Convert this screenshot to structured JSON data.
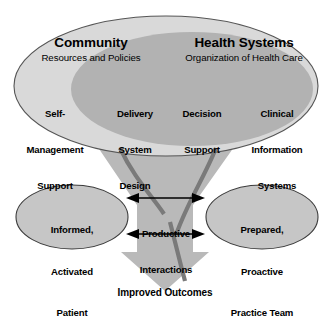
{
  "diagram": {
    "colors": {
      "background": "#ffffff",
      "outer_ellipse_fill": "#d9d9d9",
      "inner_ellipse_fill": "#b2b2b2",
      "small_oval_fill": "#c6c6c6",
      "funnel_fill": "#b9b9b9",
      "arrow_fill": "#b9b9b9",
      "curve_stroke": "#7a7a7a",
      "outline": "#3b3b3b",
      "text": "#000000"
    },
    "community": {
      "heading": "Community",
      "subheading": "Resources and Policies"
    },
    "health_systems": {
      "heading": "Health Systems",
      "subheading": "Organization of Health Care"
    },
    "pillars": [
      {
        "id": "self-management-support",
        "lines": [
          "Self-",
          "Management",
          "Support"
        ]
      },
      {
        "id": "delivery-system-design",
        "lines": [
          "Delivery",
          "System",
          "Design"
        ]
      },
      {
        "id": "decision-support",
        "lines": [
          "Decision",
          "Support"
        ]
      },
      {
        "id": "clinical-information-systems",
        "lines": [
          "Clinical",
          "Information",
          "Systems"
        ]
      }
    ],
    "patient_oval": {
      "lines": [
        "Informed,",
        "Activated",
        "Patient"
      ]
    },
    "team_oval": {
      "lines": [
        "Prepared,",
        "Proactive",
        "Practice Team"
      ]
    },
    "interactions": {
      "lines": [
        "Productive",
        "Interactions"
      ]
    },
    "outcome": {
      "label": "Improved Outcomes"
    }
  }
}
